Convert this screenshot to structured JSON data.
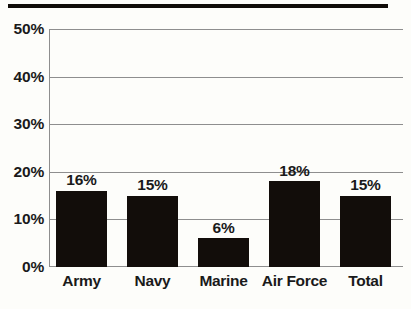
{
  "chart_data": {
    "type": "bar",
    "title": "",
    "subtitle": "",
    "xlabel": "",
    "ylabel": "",
    "categories": [
      "Army",
      "Navy",
      "Marine",
      "Air Force",
      "Total"
    ],
    "values": [
      16,
      15,
      6,
      18,
      15
    ],
    "value_labels": [
      "16%",
      "15%",
      "6%",
      "18%",
      "15%"
    ],
    "ylim": [
      0,
      50
    ],
    "ytick_values": [
      0,
      10,
      20,
      30,
      40,
      50
    ],
    "ytick_labels": [
      "0%",
      "10%",
      "20%",
      "30%",
      "40%",
      "50%"
    ],
    "grid": true,
    "legend": "none",
    "bar_color": "#120d0a",
    "grid_color": "#8e8e8e",
    "background_color": "#fdfdfa",
    "rule_color": "#100c08"
  },
  "decorations": {
    "top_rule_name": "top-horizontal-rule"
  }
}
